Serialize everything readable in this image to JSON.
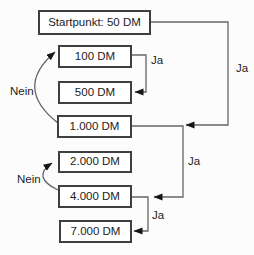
{
  "diagram": {
    "type": "flowchart",
    "nodes": {
      "start": {
        "label": "Startpunkt: 50 DM"
      },
      "dm100": {
        "label": "100 DM"
      },
      "dm500": {
        "label": "500 DM"
      },
      "dm1000": {
        "label": "1.000 DM"
      },
      "dm2000": {
        "label": "2.000 DM"
      },
      "dm4000": {
        "label": "4.000 DM"
      },
      "dm7000": {
        "label": "7.000 DM"
      }
    },
    "edge_labels": {
      "ja_start_to_1000": "Ja",
      "ja_100_to_500": "Ja",
      "ja_1000_to_4000": "Ja",
      "ja_4000_to_7000": "Ja",
      "nein_1000_to_100": "Nein",
      "nein_4000_to_2000": "Nein"
    },
    "colors": {
      "background": "#fcfcfc",
      "line": "#666666",
      "border": "#3f3f3f",
      "text": "#1c1c1c",
      "arrow": "#161616"
    }
  }
}
